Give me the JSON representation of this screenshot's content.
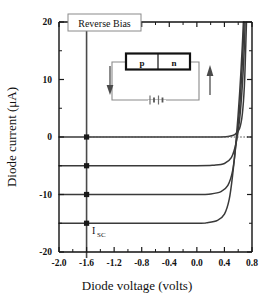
{
  "figure": {
    "width": 275,
    "height": 297,
    "background": "#ffffff"
  },
  "annotations": {
    "reverse_bias_label": "Reverse Bias",
    "isc_label_main": "I",
    "isc_label_sub": "SC"
  },
  "inset": {
    "p_label": "p",
    "n_label": "n",
    "left_arrow_icon": "arrow-down-icon",
    "right_arrow_icon": "arrow-up-icon",
    "battery_icon": "battery-icon",
    "junction_icon": "pn-junction-icon"
  },
  "colors": {
    "curve": "#3a3a3a",
    "axis": "#1a1a1a",
    "marker": "#1a1a1a",
    "vline": "#4a4a4a",
    "zero_dotted": "#555555",
    "inset_wire": "#777777",
    "inset_box_border": "#1a1a1a",
    "callout_box_border": "#888888"
  },
  "chart_data": {
    "type": "line",
    "title": "",
    "xlabel": "Diode voltage  (volts)",
    "ylabel": "Diode current (μA)",
    "xlim": [
      -2.0,
      0.8
    ],
    "ylim": [
      -20,
      20
    ],
    "xticks": [
      -2.0,
      -1.6,
      -1.2,
      -0.8,
      -0.4,
      0.0,
      0.4,
      0.8
    ],
    "xticklabels": [
      "-2.0",
      "-1.6",
      "-1.2",
      "-0.8",
      "-0.4",
      "0.0",
      "0.4",
      "0.8"
    ],
    "yticks": [
      -20,
      -10,
      0,
      10,
      20
    ],
    "yticklabels": [
      "-20",
      "-10",
      "0",
      "10",
      "20"
    ],
    "yminorticks": [
      -15,
      -5,
      5,
      15
    ],
    "xminorticks": [
      -1.8,
      -1.4,
      -1.0,
      -0.6,
      -0.2,
      0.2,
      0.6
    ],
    "grid": false,
    "legend": null,
    "reverse_bias_line_x": -1.6,
    "zero_reference_line_y": 0,
    "series": [
      {
        "name": "dark (illumination 0)",
        "saturation_current_uA": 0,
        "knee_voltage": 0.68,
        "points": [
          [
            -2.0,
            0.0
          ],
          [
            -1.0,
            0.0
          ],
          [
            0.0,
            0.0
          ],
          [
            0.3,
            0.0
          ],
          [
            0.45,
            0.1
          ],
          [
            0.55,
            0.4
          ],
          [
            0.62,
            1.5
          ],
          [
            0.66,
            4.0
          ],
          [
            0.69,
            9.0
          ],
          [
            0.71,
            16.0
          ],
          [
            0.72,
            20.0
          ]
        ]
      },
      {
        "name": "illumination 1",
        "saturation_current_uA": -5,
        "knee_voltage": 0.62,
        "points": [
          [
            -2.0,
            -5.0
          ],
          [
            -1.0,
            -5.0
          ],
          [
            0.0,
            -5.0
          ],
          [
            0.25,
            -4.9
          ],
          [
            0.4,
            -4.6
          ],
          [
            0.5,
            -3.6
          ],
          [
            0.57,
            -1.0
          ],
          [
            0.62,
            3.0
          ],
          [
            0.66,
            9.0
          ],
          [
            0.69,
            16.0
          ],
          [
            0.7,
            20.0
          ]
        ]
      },
      {
        "name": "illumination 2",
        "saturation_current_uA": -10,
        "knee_voltage": 0.57,
        "points": [
          [
            -2.0,
            -10.0
          ],
          [
            -1.0,
            -10.0
          ],
          [
            0.0,
            -10.0
          ],
          [
            0.2,
            -9.9
          ],
          [
            0.35,
            -9.5
          ],
          [
            0.45,
            -8.4
          ],
          [
            0.52,
            -5.8
          ],
          [
            0.57,
            -1.0
          ],
          [
            0.62,
            5.0
          ],
          [
            0.66,
            13.0
          ],
          [
            0.685,
            20.0
          ]
        ]
      },
      {
        "name": "illumination 3",
        "saturation_current_uA": -15,
        "knee_voltage": 0.5,
        "points": [
          [
            -2.0,
            -15.0
          ],
          [
            -1.0,
            -15.0
          ],
          [
            0.0,
            -15.0
          ],
          [
            0.15,
            -14.9
          ],
          [
            0.3,
            -14.5
          ],
          [
            0.4,
            -13.4
          ],
          [
            0.47,
            -10.8
          ],
          [
            0.52,
            -6.5
          ],
          [
            0.57,
            -0.5
          ],
          [
            0.62,
            7.5
          ],
          [
            0.66,
            16.0
          ],
          [
            0.675,
            20.0
          ]
        ]
      }
    ],
    "markers": {
      "shape": "square",
      "x": -1.6,
      "values": [
        0,
        -5,
        -10,
        -15
      ]
    }
  }
}
